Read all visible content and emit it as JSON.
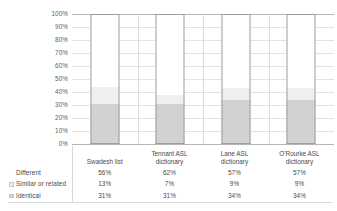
{
  "chart_data": {
    "type": "bar",
    "subtype": "stacked-100-percent-column",
    "title": "",
    "xlabel": "",
    "ylabel": "",
    "ylim": [
      0,
      100
    ],
    "grid": true,
    "legend_position": "table-left",
    "categories": [
      "Swadesh list",
      "Tennant ASL dictionary",
      "Lane ASL dictionary",
      "O'Rourke ASL dictionary"
    ],
    "category_lines": [
      [
        "Swadesh list",
        ""
      ],
      [
        "Tennant ASL",
        "dictionary"
      ],
      [
        "Lane ASL",
        "dictionary"
      ],
      [
        "O'Rourke ASL",
        "dictionary"
      ]
    ],
    "y_ticks": [
      "0%",
      "10%",
      "20%",
      "30%",
      "40%",
      "50%",
      "60%",
      "70%",
      "80%",
      "90%",
      "100%"
    ],
    "series": [
      {
        "name": "Different",
        "color": "#ffffff",
        "values": [
          56,
          62,
          57,
          57
        ],
        "labels": [
          "56%",
          "62%",
          "57%",
          "57%"
        ]
      },
      {
        "name": "Similar or related",
        "color": "#efefef",
        "values": [
          13,
          7,
          9,
          9
        ],
        "labels": [
          "13%",
          "7%",
          "9%",
          "9%"
        ]
      },
      {
        "name": "Identical",
        "color": "#d2d2d2",
        "values": [
          31,
          31,
          34,
          34
        ],
        "labels": [
          "31%",
          "31%",
          "34%",
          "34%"
        ]
      }
    ],
    "stack_order_bottom_to_top": [
      "Identical",
      "Similar or related",
      "Different"
    ]
  },
  "table": {
    "corner_header": "",
    "column_headers": [
      "Swadesh list",
      "Tennant ASL dictionary",
      "Lane ASL dictionary",
      "O'Rourke ASL dictionary"
    ],
    "rows": [
      {
        "label": "Different",
        "swatch": "#ffffff",
        "values": [
          "56%",
          "62%",
          "57%",
          "57%"
        ]
      },
      {
        "label": "Similar or related",
        "swatch": "#efefef",
        "values": [
          "13%",
          "7%",
          "9%",
          "9%"
        ]
      },
      {
        "label": "Identical",
        "swatch": "#d2d2d2",
        "values": [
          "31%",
          "31%",
          "34%",
          "34%"
        ]
      }
    ]
  },
  "colors": {
    "different": "#ffffff",
    "similar": "#efefef",
    "identical": "#d2d2d2",
    "bar_border": "#9d9d9d",
    "gridline": "#e2e2e2",
    "axis_line": "#b5b5b5",
    "table_rule": "#d9d9d9",
    "text": "#4a4a4a"
  }
}
